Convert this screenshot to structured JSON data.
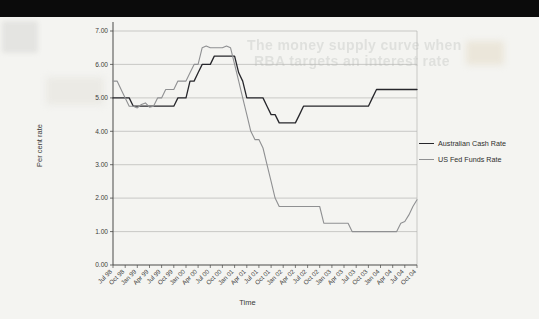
{
  "ghost": {
    "line1": "The money supply curve when",
    "line2": "RBA targets an interest rate"
  },
  "colors": {
    "page_background": "#f4f4f1",
    "top_bar": "#0b0b0b",
    "gridline": "#b6b6b3",
    "axis": "#4a4a48",
    "tick_text": "#3c3c3a",
    "australian_line": "#26262b",
    "us_line": "#8f9092"
  },
  "chart_data": {
    "type": "line",
    "title": "",
    "xlabel": "Time",
    "ylabel": "Per cent rate",
    "ylim": [
      0,
      7
    ],
    "grid": true,
    "legend_position": "right",
    "ytick_labels": [
      "0.00",
      "1.00",
      "2.00",
      "3.00",
      "4.00",
      "5.00",
      "6.00",
      "7.00"
    ],
    "x_tick_labels": [
      "Jul 98",
      "Oct 98",
      "Jan 99",
      "Apr 99",
      "Jul 99",
      "Oct 99",
      "Jan 00",
      "Apr 00",
      "Jul 00",
      "Oct 00",
      "Jan 01",
      "Apr 01",
      "Jul 01",
      "Oct 01",
      "Jan 02",
      "Apr 02",
      "Jul 02",
      "Oct 02",
      "Jan 03",
      "Apr 03",
      "Jul 03",
      "Oct 03",
      "Jan 04",
      "Apr 04",
      "Jul 04",
      "Oct 04"
    ],
    "x_unit": "month",
    "x_start": "Jul 98",
    "x_end": "Oct 04",
    "series": [
      {
        "name": "Australian Cash Rate",
        "color": "#26262b",
        "values": [
          5.0,
          5.0,
          5.0,
          5.0,
          5.0,
          4.75,
          4.75,
          4.75,
          4.75,
          4.75,
          4.75,
          4.75,
          4.75,
          4.75,
          4.75,
          4.75,
          5.0,
          5.0,
          5.0,
          5.5,
          5.5,
          5.75,
          6.0,
          6.0,
          6.0,
          6.25,
          6.25,
          6.25,
          6.25,
          6.25,
          6.25,
          5.75,
          5.5,
          5.0,
          5.0,
          5.0,
          5.0,
          5.0,
          4.75,
          4.5,
          4.5,
          4.25,
          4.25,
          4.25,
          4.25,
          4.25,
          4.5,
          4.75,
          4.75,
          4.75,
          4.75,
          4.75,
          4.75,
          4.75,
          4.75,
          4.75,
          4.75,
          4.75,
          4.75,
          4.75,
          4.75,
          4.75,
          4.75,
          4.75,
          5.0,
          5.25,
          5.25,
          5.25,
          5.25,
          5.25,
          5.25,
          5.25,
          5.25,
          5.25,
          5.25,
          5.25
        ]
      },
      {
        "name": "US Fed Funds Rate",
        "color": "#8f9092",
        "values": [
          5.5,
          5.5,
          5.25,
          5.0,
          4.75,
          4.75,
          4.7,
          4.8,
          4.85,
          4.72,
          4.75,
          5.0,
          5.0,
          5.25,
          5.25,
          5.25,
          5.5,
          5.5,
          5.5,
          5.75,
          6.0,
          6.0,
          6.5,
          6.55,
          6.5,
          6.5,
          6.5,
          6.5,
          6.55,
          6.5,
          6.0,
          5.5,
          5.0,
          4.5,
          4.0,
          3.75,
          3.75,
          3.5,
          3.0,
          2.5,
          2.0,
          1.75,
          1.75,
          1.75,
          1.75,
          1.75,
          1.75,
          1.75,
          1.75,
          1.75,
          1.75,
          1.75,
          1.25,
          1.25,
          1.25,
          1.25,
          1.25,
          1.25,
          1.25,
          1.0,
          1.0,
          1.0,
          1.0,
          1.0,
          1.0,
          1.0,
          1.0,
          1.0,
          1.0,
          1.0,
          1.0,
          1.25,
          1.3,
          1.5,
          1.75,
          1.95
        ]
      }
    ]
  }
}
